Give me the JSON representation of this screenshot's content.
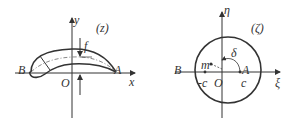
{
  "left_panel": {
    "plane_label": "(z)",
    "x_axis_label": "x",
    "y_axis_label": "y",
    "origin_label": "O",
    "point_a_label": "A",
    "point_b_label": "B",
    "camber_label": "f"
  },
  "right_panel": {
    "plane_label": "(ζ)",
    "xi_axis_label": "ξ",
    "eta_axis_label": "η",
    "origin_label": "O",
    "point_a_label": "A",
    "point_b_label": "B",
    "center_label": "m",
    "neg_c_label": "-c",
    "pos_c_label": "c",
    "angle_label": "δ"
  },
  "colors": {
    "line": "#333333"
  }
}
